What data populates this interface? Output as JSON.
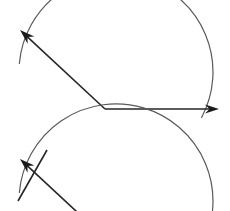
{
  "figure": {
    "background_color": "#ffffff",
    "width": 230,
    "height": 211,
    "ray_color": "#262626",
    "arc_color": "#5a5a5a",
    "ray_width": 1.6,
    "arc_width": 1.2
  },
  "chart_data": {
    "type": "diagram",
    "xlabel": "",
    "ylabel": "",
    "grid": false,
    "legend": null,
    "shapes": [
      {
        "name": "upper-vertex",
        "type": "point",
        "x": 105,
        "y": 109
      },
      {
        "name": "upper-horizontal-ray",
        "type": "ray",
        "from": [
          105,
          109
        ],
        "to": [
          219,
          109
        ],
        "arrow_at_end": true,
        "direction_degrees": 0
      },
      {
        "name": "upper-diagonal-ray",
        "type": "ray",
        "from": [
          105,
          109
        ],
        "to": [
          20,
          30
        ],
        "arrow_at_end": true,
        "direction_degrees": 137
      },
      {
        "name": "upper-arc",
        "type": "arc",
        "center": [
          105,
          109
        ],
        "radius": 97,
        "start_degrees": 152,
        "end_degrees": 355,
        "sweep_degrees": 203
      },
      {
        "name": "lower-vertex",
        "type": "point",
        "x": 105,
        "y": 238
      },
      {
        "name": "lower-diagonal-ray",
        "type": "ray",
        "from": [
          105,
          238
        ],
        "to": [
          20,
          159
        ],
        "arrow_at_end": true,
        "direction_degrees": 137
      },
      {
        "name": "lower-arc",
        "type": "arc",
        "center": [
          105,
          238
        ],
        "radius": 97,
        "start_degrees": 152,
        "end_degrees": 355,
        "sweep_degrees": 203
      },
      {
        "name": "lower-construction-line",
        "type": "segment",
        "from": [
          47,
          150
        ],
        "to": [
          18,
          201
        ]
      }
    ],
    "angle_measure_degrees": 137,
    "labels": []
  }
}
